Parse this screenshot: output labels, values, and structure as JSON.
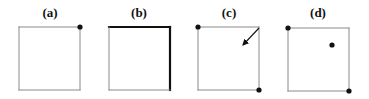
{
  "figure": {
    "panels": [
      {
        "label": "(a)",
        "label_x": 50,
        "box": {
          "x": 19,
          "y": 27,
          "w": 61,
          "h": 63
        },
        "thick_edges": [],
        "dots": [
          [
            80,
            27
          ]
        ],
        "arrow": null
      },
      {
        "label": "(b)",
        "label_x": 139,
        "box": {
          "x": 109,
          "y": 27,
          "w": 61,
          "h": 63
        },
        "thick_edges": [
          "top",
          "right"
        ],
        "dots": [],
        "arrow": null
      },
      {
        "label": "(c)",
        "label_x": 229,
        "box": {
          "x": 198,
          "y": 27,
          "w": 61,
          "h": 63
        },
        "thick_edges": [],
        "dots": [
          [
            198,
            27
          ],
          [
            259,
            90
          ]
        ],
        "arrow": {
          "from": [
            259,
            28
          ],
          "to": [
            243,
            45
          ]
        }
      },
      {
        "label": "(d)",
        "label_x": 318,
        "box": {
          "x": 288,
          "y": 28,
          "w": 61,
          "h": 63
        },
        "thick_edges": [],
        "dots": [
          [
            288,
            28
          ],
          [
            349,
            91
          ],
          [
            332,
            45
          ]
        ],
        "arrow": null
      }
    ],
    "colors": {
      "thin_line": "#8a8a8a",
      "thick_line": "#111111",
      "dot": "#111111"
    }
  }
}
